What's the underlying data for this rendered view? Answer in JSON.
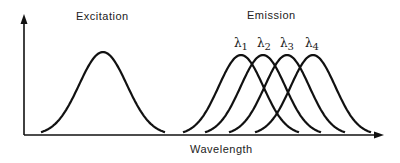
{
  "chart_data": {
    "type": "line",
    "title": "",
    "xlabel": "Wavelength",
    "ylabel": "",
    "grid": false,
    "legend": null,
    "annotations": [
      "Excitation",
      "Emission",
      "λ1",
      "λ2",
      "λ3",
      "λ4"
    ],
    "series": [
      {
        "name": "Excitation",
        "peak_x_px": 103,
        "peak_y_px": 52,
        "half_width_px": 62
      },
      {
        "name": "λ1",
        "peak_x_px": 241,
        "peak_y_px": 55,
        "half_width_px": 58
      },
      {
        "name": "λ2",
        "peak_x_px": 263,
        "peak_y_px": 55,
        "half_width_px": 58
      },
      {
        "name": "λ3",
        "peak_x_px": 287,
        "peak_y_px": 55,
        "half_width_px": 58
      },
      {
        "name": "λ4",
        "peak_x_px": 313,
        "peak_y_px": 55,
        "half_width_px": 58
      }
    ]
  },
  "labels": {
    "excitation": "Excitation",
    "emission": "Emission",
    "xaxis": "Wavelength",
    "lambda_symbol": "λ",
    "lambdas": [
      "1",
      "2",
      "3",
      "4"
    ]
  }
}
